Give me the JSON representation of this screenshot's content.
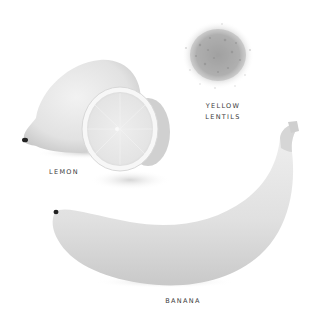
{
  "items": [
    {
      "id": "lemon",
      "label": "LEMON"
    },
    {
      "id": "yellow-lentils",
      "label_line1": "YELLOW",
      "label_line2": "LENTILS"
    },
    {
      "id": "banana",
      "label": "BANANA"
    }
  ],
  "colors": {
    "background": "#ffffff",
    "fruit_fill": "#e6e6e6",
    "fruit_shade": "#c9c9c9",
    "label_text": "#3a3a3a"
  }
}
